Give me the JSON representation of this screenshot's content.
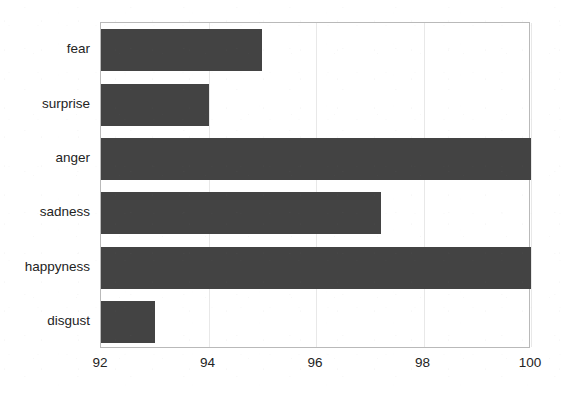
{
  "chart_data": {
    "type": "bar",
    "orientation": "horizontal",
    "title": "",
    "xlabel": "",
    "ylabel": "",
    "categories": [
      "fear",
      "surprise",
      "anger",
      "sadness",
      "happyness",
      "disgust"
    ],
    "values": [
      95.0,
      94.0,
      100.0,
      97.2,
      100.0,
      93.0
    ],
    "xlim": [
      92,
      100
    ],
    "xticks": [
      92,
      94,
      96,
      98,
      100
    ],
    "xtick_labels": [
      "92",
      "94",
      "96",
      "98",
      "100"
    ],
    "grid": true,
    "grid_axis": "x",
    "legend": false,
    "bar_color": "#434343",
    "frame_color": "#b9b9b9",
    "background_color": "#ffffff"
  },
  "figure": {
    "name": "horizontal-bar-chart",
    "bars": [
      {
        "label": "fear",
        "value": 95.0,
        "value_text": "95.0"
      },
      {
        "label": "surprise",
        "value": 94.0,
        "value_text": "94.0"
      },
      {
        "label": "anger",
        "value": 100.0,
        "value_text": "100.0"
      },
      {
        "label": "sadness",
        "value": 97.2,
        "value_text": "97.2"
      },
      {
        "label": "happyness",
        "value": 100.0,
        "value_text": "100.0"
      },
      {
        "label": "disgust",
        "value": 93.0,
        "value_text": "93.0"
      }
    ],
    "xaxis": {
      "min": 92,
      "max": 100,
      "ticks": [
        {
          "value": 92,
          "label": "92"
        },
        {
          "value": 94,
          "label": "94"
        },
        {
          "value": 96,
          "label": "96"
        },
        {
          "value": 98,
          "label": "98"
        },
        {
          "value": 100,
          "label": "100"
        }
      ]
    }
  }
}
